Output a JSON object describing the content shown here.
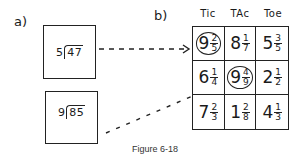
{
  "figure": {
    "caption": "Figure 6-18",
    "part_a": {
      "label": "a)",
      "problems": [
        {
          "divisor": "5",
          "dividend": "47"
        },
        {
          "divisor": "9",
          "dividend": "85"
        }
      ]
    },
    "part_b": {
      "label": "b)",
      "column_headers": [
        "Tic",
        "TAc",
        "Toe"
      ],
      "grid": [
        [
          {
            "whole": "9",
            "num": "2",
            "den": "5",
            "circled": true
          },
          {
            "whole": "8",
            "num": "1",
            "den": "7",
            "circled": false
          },
          {
            "whole": "5",
            "num": "3",
            "den": "5",
            "circled": false
          }
        ],
        [
          {
            "whole": "6",
            "num": "1",
            "den": "4",
            "circled": false
          },
          {
            "whole": "9",
            "num": "4",
            "den": "9",
            "circled": true
          },
          {
            "whole": "2",
            "num": "1",
            "den": "2",
            "circled": false
          }
        ],
        [
          {
            "whole": "7",
            "num": "2",
            "den": "3",
            "circled": false
          },
          {
            "whole": "1",
            "num": "2",
            "den": "8",
            "circled": false
          },
          {
            "whole": "4",
            "num": "1",
            "den": "3",
            "circled": false
          }
        ]
      ]
    },
    "connectors": [
      {
        "from": "problem-1",
        "to": "cell-0-0",
        "style": "dashed",
        "arrowhead": true
      },
      {
        "from": "problem-2",
        "to": "cell-2-0",
        "style": "dashed",
        "arrowhead": false
      }
    ]
  }
}
